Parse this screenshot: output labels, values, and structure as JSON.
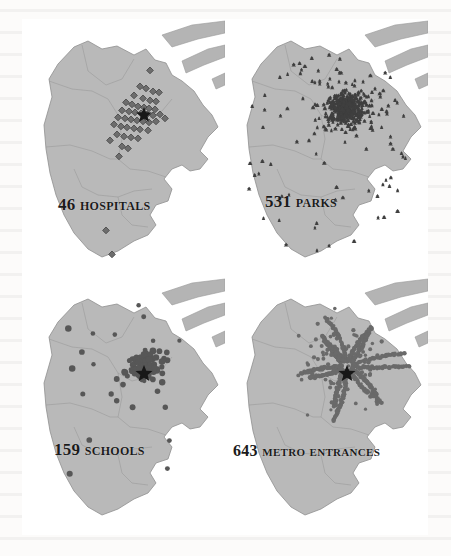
{
  "figure": {
    "kind": "four-panel point-density map plate",
    "region": "Shanghai municipality",
    "frame_color": "#9b9b9b",
    "land_color": "#b9b9b9",
    "water_color": "#ffffff"
  },
  "panels": [
    {
      "id": "hospitals",
      "count": "46",
      "category": "Hospitals",
      "caption": "46 Hospitals",
      "marker_icon": "diamond-marker-icon",
      "marker_color": "#6d6d6d",
      "center_icon": "star-icon",
      "point_count": 46
    },
    {
      "id": "parks",
      "count": "531",
      "category": "Parks",
      "caption": "531 Parks",
      "marker_icon": "tree-marker-icon",
      "marker_color": "#3f3f3f",
      "center_icon": "none",
      "point_count": 531
    },
    {
      "id": "schools",
      "count": "159",
      "category": "Schools",
      "caption": "159 Schools",
      "marker_icon": "blob-marker-icon",
      "marker_color": "#575757",
      "center_icon": "star-icon",
      "point_count": 159
    },
    {
      "id": "metro",
      "count": "643",
      "category": "Metro Entrances",
      "caption": "643 Metro Entrances",
      "marker_icon": "dot-marker-icon",
      "marker_color": "#6a6a6a",
      "center_icon": "star-icon",
      "point_count": 643
    }
  ],
  "chart_data": {
    "type": "scatter",
    "title": "",
    "subplots": [
      {
        "label": "46 Hospitals",
        "value": 46,
        "category": "Hospitals"
      },
      {
        "label": "531 Parks",
        "value": 531,
        "category": "Parks"
      },
      {
        "label": "159 Schools",
        "value": 159,
        "category": "Schools"
      },
      {
        "label": "643 Metro Entrances",
        "value": 643,
        "category": "Metro Entrances"
      }
    ],
    "categories": [
      "Hospitals",
      "Parks",
      "Schools",
      "Metro Entrances"
    ],
    "values": [
      46,
      531,
      159,
      643
    ],
    "xlabel": "",
    "ylabel": "",
    "legend": []
  }
}
